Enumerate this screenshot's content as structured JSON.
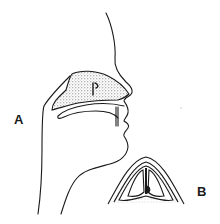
{
  "figure": {
    "labels": {
      "a": "A",
      "b": "B"
    },
    "colors": {
      "line": "#1a1a1a",
      "stipple": "#8a8a8a",
      "background": "#ffffff"
    }
  }
}
